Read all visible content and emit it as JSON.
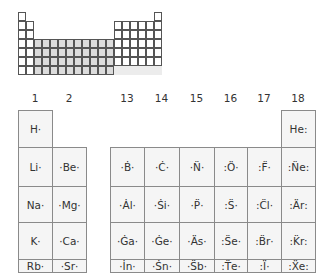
{
  "mini_table": {
    "columns": 18,
    "rows": 7,
    "shaded_block": "d-block (groups 3-12)",
    "colors": {
      "grid": "#555555",
      "d_block": "#dcdcdc",
      "s_p_block": "#ffffff"
    }
  },
  "main_table": {
    "group_headers": [
      "1",
      "2",
      "13",
      "14",
      "15",
      "16",
      "17",
      "18"
    ],
    "rows": [
      {
        "period": 1,
        "cells": {
          "1": "H·",
          "18": "He:"
        }
      },
      {
        "period": 2,
        "cells": {
          "1": "Li·",
          "2": "·Be·",
          "13": "·Ḃ·",
          "14": "·Ċ·",
          "15": "·N̈·",
          "16": ":Ö·",
          "17": ":F̈·",
          "18": ":N̈e:"
        }
      },
      {
        "period": 3,
        "cells": {
          "1": "Na·",
          "2": "·Mg·",
          "13": "·Ȧl·",
          "14": "·Ṡi·",
          "15": "·P̈·",
          "16": ":S̈·",
          "17": ":C̈l·",
          "18": ":Är:"
        }
      },
      {
        "period": 4,
        "cells": {
          "1": "K·",
          "2": "·Ca·",
          "13": "·Ġa·",
          "14": "·Ġe·",
          "15": "·Äs·",
          "16": ":S̈e·",
          "17": ":B̈r·",
          "18": ":K̈r:"
        }
      },
      {
        "period": 5,
        "cells": {
          "1": "Rb·",
          "2": "·Sr·",
          "13": "·İn·",
          "14": "·Ṡn·",
          "15": "·S̈b·",
          "16": ":T̈e·",
          "17": ":Ï·",
          "18": ":Ẍe:"
        }
      }
    ],
    "colors": {
      "cell_bg": "#f5f5f5",
      "cell_border": "#8a8a8a",
      "text": "#333333"
    }
  }
}
